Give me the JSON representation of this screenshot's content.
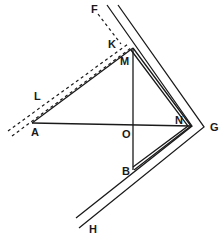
{
  "diagram": {
    "type": "geometry-figure",
    "stroke_color": "#1a1a1a",
    "background": "#ffffff",
    "labels": {
      "A": "A",
      "B": "B",
      "F": "F",
      "G": "G",
      "H": "H",
      "K": "K",
      "L": "L",
      "M": "M",
      "N": "N",
      "O": "O"
    }
  }
}
